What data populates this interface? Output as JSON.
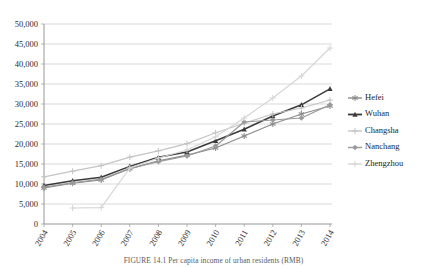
{
  "figure": {
    "caption": "FIGURE 14.1  Per capita income of urban residents (RMB)"
  },
  "chart_data": {
    "type": "line",
    "title": "",
    "xlabel": "",
    "ylabel": "",
    "x": [
      "2004",
      "2005",
      "2006",
      "2007",
      "2008",
      "2009",
      "2010",
      "2011",
      "2012",
      "2013",
      "2014"
    ],
    "ylim": [
      0,
      50000
    ],
    "ytick_step": 5000,
    "ytick_labels": [
      "0",
      "5,000",
      "10,000",
      "15,000",
      "20,000",
      "25,000",
      "30,000",
      "35,000",
      "40,000",
      "45,000",
      "50,000"
    ],
    "grid": true,
    "legend_position": "right",
    "series": [
      {
        "name": "Hefei",
        "color": "#8c8c8c",
        "marker": "asterisk",
        "values": [
          9000,
          10200,
          11000,
          13800,
          15800,
          17200,
          19000,
          22000,
          25000,
          27500,
          29500
        ]
      },
      {
        "name": "Wuhan",
        "color": "#3a3a3a",
        "marker": "triangle",
        "values": [
          9600,
          10800,
          11700,
          14400,
          16700,
          18000,
          20800,
          23700,
          27000,
          29800,
          33800
        ]
      },
      {
        "name": "Changsha",
        "color": "#c4c4c4",
        "marker": "plus",
        "values": [
          11800,
          13200,
          14600,
          16700,
          18300,
          20100,
          22800,
          25200,
          27500,
          29000,
          31000
        ]
      },
      {
        "name": "Nanchang",
        "color": "#9a9a9a",
        "marker": "diamond",
        "values": [
          9200,
          10300,
          11200,
          13900,
          15600,
          17000,
          19500,
          25500,
          26000,
          26500,
          29800
        ]
      },
      {
        "name": "Zhengzhou",
        "color": "#d6d6d6",
        "marker": "plus-light",
        "values": [
          null,
          4000,
          4100,
          14000,
          16500,
          18500,
          21800,
          26500,
          31500,
          37000,
          44000
        ]
      }
    ]
  }
}
